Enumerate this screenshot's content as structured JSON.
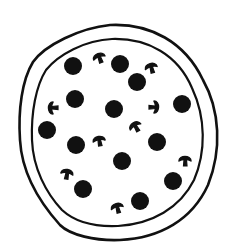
{
  "illustration": {
    "subject": "pizza",
    "colors": {
      "background": "#ffffff",
      "ink": "#111111"
    },
    "crust": {
      "outer_path": "M 33 62 C 45 45, 80 28, 110 25 C 150 23, 185 42, 203 80 C 220 110, 222 150, 208 185 C 192 220, 160 238, 120 240 C 95 241, 70 235, 60 225 C 42 205, 22 175, 20 140 C 18 110, 22 80, 33 62 Z",
      "inner_path": "M 46 70 C 58 55, 85 40, 112 39 C 148 38, 178 55, 192 88 C 206 118, 206 152, 194 180 C 180 208, 152 224, 118 226 C 95 227, 75 222, 62 210 C 46 193, 33 168, 32 140 C 31 112, 36 86, 46 70 Z"
    },
    "pepperoni": [
      {
        "cx": 73,
        "cy": 66,
        "r": 9
      },
      {
        "cx": 120,
        "cy": 64,
        "r": 9
      },
      {
        "cx": 137,
        "cy": 82,
        "r": 9
      },
      {
        "cx": 75,
        "cy": 99,
        "r": 9
      },
      {
        "cx": 114,
        "cy": 109,
        "r": 9
      },
      {
        "cx": 182,
        "cy": 104,
        "r": 9
      },
      {
        "cx": 47,
        "cy": 130,
        "r": 9
      },
      {
        "cx": 76,
        "cy": 145,
        "r": 9
      },
      {
        "cx": 157,
        "cy": 142,
        "r": 9
      },
      {
        "cx": 122,
        "cy": 161,
        "r": 9
      },
      {
        "cx": 173,
        "cy": 181,
        "r": 9
      },
      {
        "cx": 83,
        "cy": 189,
        "r": 9
      },
      {
        "cx": 140,
        "cy": 201,
        "r": 9
      }
    ],
    "mushrooms": [
      {
        "x": 99,
        "y": 57,
        "rotate": -20
      },
      {
        "x": 151,
        "y": 67,
        "rotate": -15
      },
      {
        "x": 52,
        "y": 108,
        "rotate": -90
      },
      {
        "x": 155,
        "y": 107,
        "rotate": 90
      },
      {
        "x": 135,
        "y": 126,
        "rotate": -30
      },
      {
        "x": 99,
        "y": 140,
        "rotate": -10
      },
      {
        "x": 185,
        "y": 160,
        "rotate": 0
      },
      {
        "x": 67,
        "y": 173,
        "rotate": 10
      },
      {
        "x": 117,
        "y": 207,
        "rotate": -15
      }
    ]
  }
}
